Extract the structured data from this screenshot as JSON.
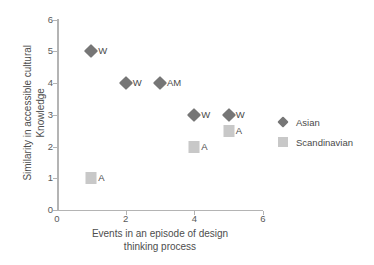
{
  "chart_data": {
    "type": "scatter",
    "title": "",
    "xlabel": "Events in an episode of design thinking process",
    "ylabel": "Similarity in accessible cultural Knowledge",
    "xlim": [
      0,
      6
    ],
    "ylim": [
      0,
      6
    ],
    "xticks": [
      0,
      2,
      4,
      6
    ],
    "yticks": [
      0,
      1,
      2,
      3,
      4,
      5,
      6
    ],
    "grid": false,
    "legend_position": "right",
    "series": [
      {
        "name": "Asian",
        "marker": "diamond",
        "color": "#767676",
        "points": [
          {
            "x": 1,
            "y": 5,
            "label": "W"
          },
          {
            "x": 2,
            "y": 4,
            "label": "W"
          },
          {
            "x": 3,
            "y": 4,
            "label": "AM"
          },
          {
            "x": 4,
            "y": 3,
            "label": "W"
          },
          {
            "x": 5,
            "y": 3,
            "label": "W"
          }
        ]
      },
      {
        "name": "Scandinavian",
        "marker": "square",
        "color": "#c8c8c8",
        "points": [
          {
            "x": 1,
            "y": 1,
            "label": "A"
          },
          {
            "x": 4,
            "y": 2,
            "label": "A"
          },
          {
            "x": 5,
            "y": 2.5,
            "label": "A"
          }
        ]
      }
    ]
  },
  "axes": {
    "y_title_line1": "Similarity in accessible cultural",
    "y_title_line2": "Knowledge",
    "x_title_line1": "Events in an episode of design",
    "x_title_line2": "thinking process",
    "ytick_labels": [
      "0",
      "1",
      "2",
      "3",
      "4",
      "5",
      "6"
    ],
    "xtick_labels": [
      "0",
      "2",
      "4",
      "6"
    ]
  },
  "legend": {
    "entries": [
      {
        "label": "Asian",
        "marker": "diamond-icon"
      },
      {
        "label": "Scandinavian",
        "marker": "square-icon"
      }
    ]
  }
}
